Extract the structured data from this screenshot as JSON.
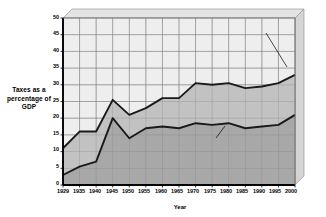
{
  "chart_data": {
    "type": "area",
    "title": "",
    "subtitle": "",
    "xlabel": "Year",
    "ylabel": "Taxes as a percentage of GDP",
    "ylabel_lines": [
      "Taxes",
      "as a",
      "percentage",
      "of GDP"
    ],
    "categories": [
      "1929",
      "1935",
      "1940",
      "1945",
      "1950",
      "1955",
      "1960",
      "1965",
      "1970",
      "1975",
      "1980",
      "1985",
      "1990",
      "1995",
      "2000"
    ],
    "ylim": [
      0,
      50
    ],
    "yticks": [
      0,
      5,
      10,
      15,
      20,
      25,
      30,
      35,
      40,
      45,
      50
    ],
    "grid": true,
    "legend_position": "inline-annotations",
    "stacked": true,
    "series": [
      {
        "name": "Federal government taxes",
        "color": "#a8a8a8",
        "values": [
          3,
          5.5,
          7,
          20,
          14,
          17,
          17.5,
          17,
          18.5,
          18,
          18.5,
          17,
          17.5,
          18,
          21
        ]
      },
      {
        "name": "State and local government taxes",
        "color": "#c2c2c2",
        "values": [
          8,
          10.5,
          9,
          5.5,
          7,
          6,
          8.5,
          9,
          12,
          12,
          12,
          12,
          12,
          12.5,
          12
        ]
      }
    ],
    "total_series": {
      "name": "Total government taxes",
      "values": [
        11,
        16,
        16,
        25.5,
        21,
        23,
        26,
        26,
        30.5,
        30,
        30.5,
        29,
        29.5,
        30.5,
        33
      ]
    },
    "annotations": [
      {
        "id": "total",
        "text": "Total government\ntaxes"
      },
      {
        "id": "state_local",
        "text": "State and local\ngovernment taxes"
      },
      {
        "id": "federal",
        "text": "Federal government\ntaxes"
      }
    ],
    "colors": {
      "plot_background": "#eeeeee",
      "federal_band": "#a8a8a8",
      "state_local_band": "#c2c2c2",
      "grid": "#8a8a8a",
      "axis": "#000000",
      "bevel_light": "#e4e4e4",
      "bevel_side": "#d4d4d4",
      "line": "#1a1a1a"
    }
  }
}
